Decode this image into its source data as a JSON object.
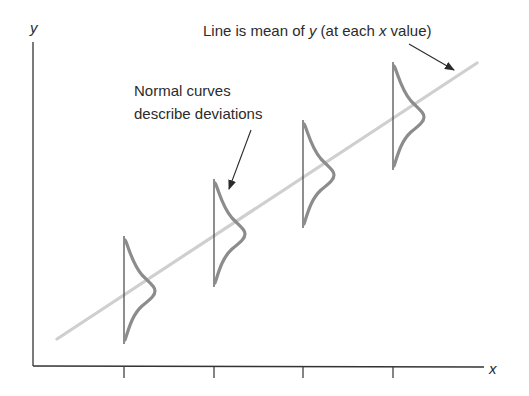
{
  "diagram": {
    "axes": {
      "y_label": "y",
      "x_label": "x",
      "tick_count": 4
    },
    "annotations": {
      "mean_line": {
        "text_prefix": "Line is mean of ",
        "text_y": "y",
        "text_middle": " (at each ",
        "text_x": "x",
        "text_suffix": " value)"
      },
      "normal_curves": {
        "line1": "Normal curves",
        "line2": "describe deviations"
      }
    },
    "colors": {
      "axis": "#333333",
      "mean_line": "#cfcfcf",
      "curve": "#8c8c8c",
      "text": "#2b2b2b"
    }
  }
}
